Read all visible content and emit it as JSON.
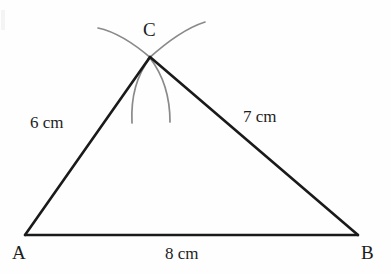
{
  "figure": {
    "background_color": "#fefefe",
    "line_color": "#1a1a1a",
    "arc_color": "#8a8a8a",
    "text_color": "#1d1d1d"
  },
  "vertices": {
    "A": {
      "label": "A",
      "x": 25,
      "y": 235
    },
    "B": {
      "label": "B",
      "x": 358,
      "y": 235
    },
    "C": {
      "label": "C",
      "x": 150,
      "y": 57
    }
  },
  "sides": {
    "ac": {
      "label": "6 cm",
      "from": "A",
      "to": "C",
      "length_cm": 6
    },
    "bc": {
      "label": "7 cm",
      "from": "B",
      "to": "C",
      "length_cm": 7
    },
    "ab": {
      "label": "8 cm",
      "from": "A",
      "to": "B",
      "length_cm": 8
    }
  },
  "construction_arcs": [
    {
      "name": "upper-left-arc",
      "from_x": 98,
      "from_y": 28,
      "ctrl_x": 122,
      "ctrl_y": 33,
      "to_x": 152,
      "to_y": 59
    },
    {
      "name": "upper-right-arc",
      "from_x": 205,
      "from_y": 22,
      "ctrl_x": 180,
      "ctrl_y": 30,
      "to_x": 148,
      "to_y": 59
    },
    {
      "name": "lower-left-arc",
      "from_x": 150,
      "from_y": 58,
      "ctrl_x": 130,
      "ctrl_y": 84,
      "to_x": 132,
      "to_y": 123
    },
    {
      "name": "lower-right-arc",
      "from_x": 150,
      "from_y": 58,
      "ctrl_x": 170,
      "ctrl_y": 84,
      "to_x": 170,
      "to_y": 122
    }
  ]
}
